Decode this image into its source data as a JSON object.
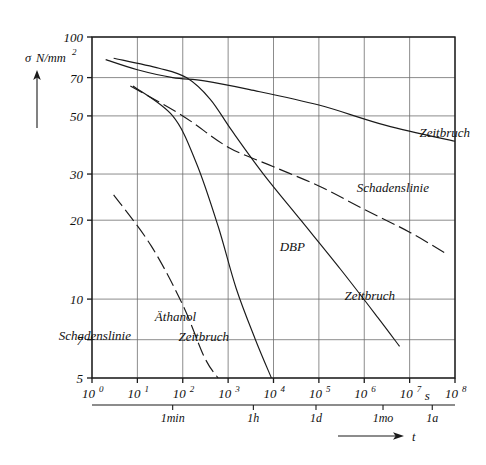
{
  "chart_data": {
    "type": "line",
    "title": "",
    "xlabel": "t",
    "ylabel": "σ N/mm",
    "ylabel_sup": "2",
    "xunit": "s",
    "xscale": "log",
    "yscale": "log",
    "grid": true,
    "xlim": [
      1,
      100000000
    ],
    "ylim": [
      5,
      100
    ],
    "x_ticks": [
      {
        "mantissa": "10",
        "exp": "0",
        "value": 1
      },
      {
        "mantissa": "10",
        "exp": "1",
        "value": 10
      },
      {
        "mantissa": "10",
        "exp": "2",
        "value": 100
      },
      {
        "mantissa": "10",
        "exp": "3",
        "value": 1000
      },
      {
        "mantissa": "10",
        "exp": "4",
        "value": 10000
      },
      {
        "mantissa": "10",
        "exp": "5",
        "value": 100000
      },
      {
        "mantissa": "10",
        "exp": "6",
        "value": 1000000
      },
      {
        "mantissa": "10",
        "exp": "7",
        "value": 10000000
      },
      {
        "mantissa": "10",
        "exp": "8",
        "value": 100000000
      }
    ],
    "y_ticks": [
      {
        "label": "100",
        "value": 100
      },
      {
        "label": "70",
        "value": 70
      },
      {
        "label": "50",
        "value": 50
      },
      {
        "label": "30",
        "value": 30
      },
      {
        "label": "20",
        "value": 20
      },
      {
        "label": "10",
        "value": 10
      },
      {
        "label": "7",
        "value": 7
      },
      {
        "label": "5",
        "value": 5
      }
    ],
    "time_markers": [
      {
        "label": "1min",
        "value": 60
      },
      {
        "label": "1h",
        "value": 3600
      },
      {
        "label": "1d",
        "value": 86400
      },
      {
        "label": "1mo",
        "value": 2592000
      },
      {
        "label": "1a",
        "value": 31536000
      }
    ],
    "series": [
      {
        "name": "Zeitbruch (Luft)",
        "label": "Zeitbruch",
        "style": "solid",
        "label_x": 470,
        "label_y": 137,
        "points": [
          [
            2.0,
            82
          ],
          [
            10,
            75
          ],
          [
            60,
            70
          ],
          [
            300,
            68
          ],
          [
            3000,
            63
          ],
          [
            100000,
            55
          ],
          [
            3000000,
            46
          ],
          [
            100000000,
            40
          ]
        ]
      },
      {
        "name": "Schadenslinie (obere)",
        "label": "Schadenslinie",
        "style": "dashed",
        "label_x": 429,
        "label_y": 192,
        "points": [
          [
            7,
            65
          ],
          [
            100,
            50
          ],
          [
            1000,
            38
          ],
          [
            10000,
            32
          ],
          [
            100000,
            27
          ],
          [
            1000000,
            22
          ],
          [
            10000000,
            18
          ],
          [
            60000000,
            15
          ]
        ]
      },
      {
        "name": "DBP Zeitbruch",
        "label": "DBP",
        "label2": "Zeitbruch",
        "style": "solid",
        "label_x": 305,
        "label_y": 251,
        "label2_x": 395,
        "label2_y": 300,
        "points": [
          [
            3,
            83
          ],
          [
            30,
            76
          ],
          [
            120,
            70
          ],
          [
            400,
            58
          ],
          [
            1200,
            44
          ],
          [
            6000,
            30
          ],
          [
            40000,
            20
          ],
          [
            300000,
            13
          ],
          [
            2000000,
            8.5
          ],
          [
            6000000,
            6.6
          ]
        ]
      },
      {
        "name": "Äthanol Zeitbruch",
        "label": "Äthanol",
        "label2": "Zeitbruch",
        "style": "solid",
        "label_x": 196,
        "label_y": 321,
        "label2_x": 229,
        "label2_y": 341,
        "points": [
          [
            8,
            65
          ],
          [
            60,
            50
          ],
          [
            200,
            33
          ],
          [
            600,
            19
          ],
          [
            1500,
            11
          ],
          [
            4000,
            7
          ],
          [
            9000,
            5
          ]
        ]
      },
      {
        "name": "Äthanol Schadenslinie",
        "label": "Schadenslinie",
        "style": "dashed",
        "label_x": 131,
        "label_y": 340,
        "points": [
          [
            3,
            25
          ],
          [
            20,
            16
          ],
          [
            100,
            9.5
          ],
          [
            300,
            6.0
          ],
          [
            600,
            5.0
          ]
        ]
      }
    ],
    "axis_arrow_y": "up",
    "axis_arrow_x": "right"
  },
  "colors": {
    "ink": "#1a1a1a",
    "grid": "#6f6f6f",
    "background": "#ffffff"
  }
}
